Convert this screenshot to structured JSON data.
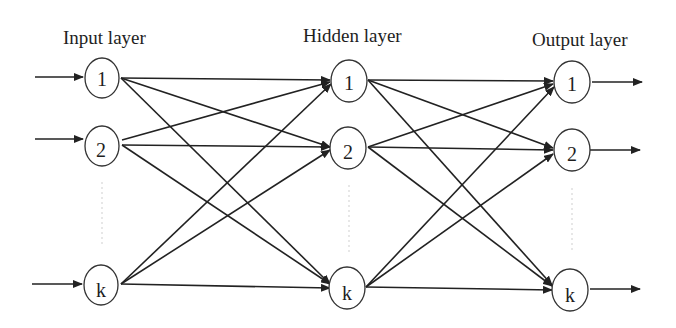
{
  "diagram": {
    "layers": [
      {
        "name": "input",
        "label": "Input layer",
        "nodes": [
          "1",
          "2",
          "k"
        ]
      },
      {
        "name": "hidden",
        "label": "Hidden layer",
        "nodes": [
          "1",
          "2",
          "k"
        ]
      },
      {
        "name": "output",
        "label": "Output layer",
        "nodes": [
          "1",
          "2",
          "k"
        ]
      }
    ],
    "connections": "fully connected between adjacent layers",
    "colors": {
      "stroke": "#222222",
      "background": "#ffffff",
      "ellipsis": "#cfcfcf"
    }
  }
}
